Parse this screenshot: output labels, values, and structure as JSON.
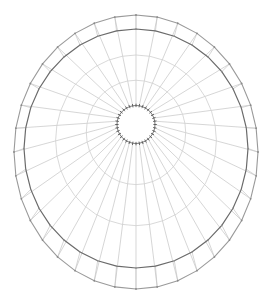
{
  "diagram": {
    "type": "radial-wireframe-mesh",
    "canvas": {
      "width": 269,
      "height": 299,
      "background": "#ffffff"
    },
    "spoke_count": 36,
    "inner_circle": {
      "cx": 136,
      "cy": 124.5,
      "r": 19
    },
    "main_ring": {
      "cx": 136,
      "cy": 148.5,
      "rx": 112,
      "ry": 119.5
    },
    "outer_ring": {
      "cx": 136,
      "cy": 152,
      "rx": 122,
      "ry": 137
    },
    "intermediate_ring_fractions": [
      0.33,
      0.66
    ],
    "colors": {
      "spoke": "#c4c4c4",
      "main_ring": "#6a6a6a",
      "outer_ring": "#9a9a9a",
      "inner_ticks": "#555555",
      "nodes": "#8a8a8a"
    }
  }
}
